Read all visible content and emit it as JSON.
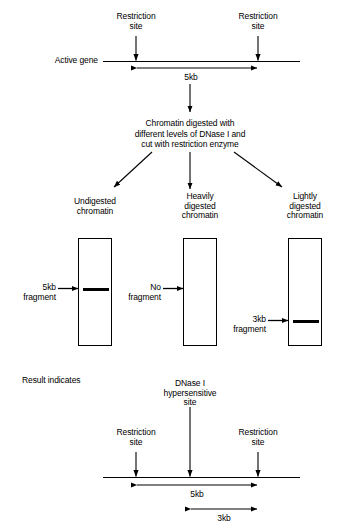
{
  "top_section": {
    "gene_label": "Active gene",
    "restriction_site_left": "Restriction\nsite",
    "restriction_site_right": "Restriction\nsite",
    "span_label": "5kb"
  },
  "treatment": {
    "text": "Chromatin digested with\ndifferent levels of DNase I and\ncut with restriction enzyme"
  },
  "panels": [
    {
      "title": "Undigested\nchromatin",
      "fragment_label": "5kb\nfragment",
      "has_band": true
    },
    {
      "title": "Heavily\ndigested\nchromatin",
      "fragment_label": "No\nfragment",
      "has_band": false
    },
    {
      "title": "Lightly\ndigested\nchromatin",
      "fragment_label": "3kb\nfragment",
      "has_band": true
    }
  ],
  "result_section": {
    "heading": "Result indicates",
    "hypersensitive_label": "DNase I\nhypersensitive\nsite",
    "restriction_site_left": "Restriction\nsite",
    "restriction_site_right": "Restriction\nsite",
    "span_label_5kb": "5kb",
    "span_label_3kb": "3kb"
  },
  "colors": {
    "ink": "#000000",
    "paper": "#ffffff"
  }
}
